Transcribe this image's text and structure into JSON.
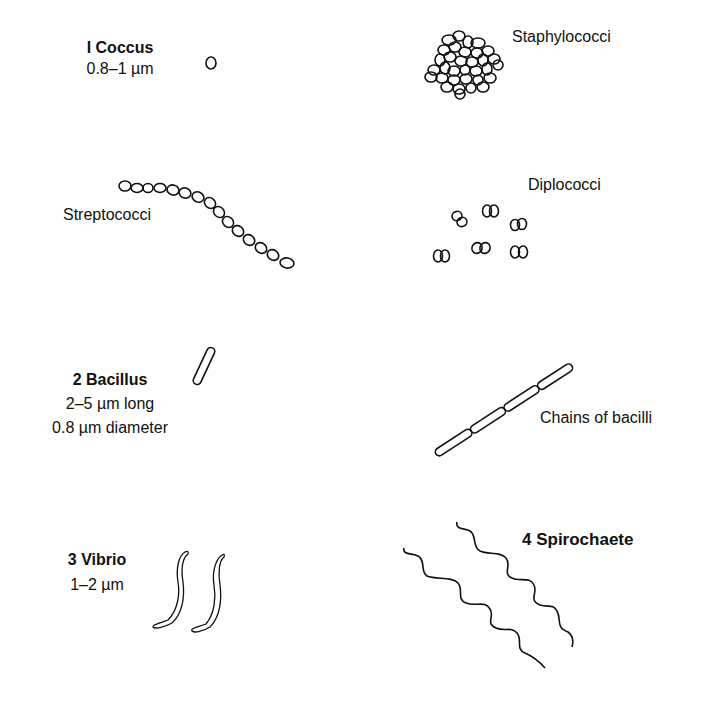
{
  "diagram": {
    "type": "bacterial-morphology-illustration",
    "stroke_color": "#111111",
    "background": "#ffffff"
  },
  "coccus": {
    "title": "I Coccus",
    "size": "0.8–1 µm",
    "arrangements": {
      "staphylococci": "Staphylococci",
      "streptococci": "Streptococci",
      "diplococci": "Diplococci"
    }
  },
  "bacillus": {
    "title": "2 Bacillus",
    "length": "2–5 µm long",
    "diameter": "0.8 µm diameter",
    "arrangements": {
      "chains": "Chains of bacilli"
    }
  },
  "vibrio": {
    "title": "3 Vibrio",
    "size": "1–2 µm"
  },
  "spirochaete": {
    "title": "4 Spirochaete"
  }
}
